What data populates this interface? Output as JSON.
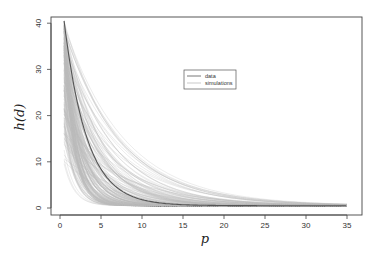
{
  "chart_data": {
    "type": "line",
    "title": "",
    "xlabel": "p",
    "ylabel": "h(d)",
    "xlim": [
      -1.5,
      37.5
    ],
    "ylim": [
      -1.5,
      41.5
    ],
    "x_ticks": [
      0,
      5,
      10,
      15,
      20,
      25,
      30,
      35
    ],
    "y_ticks": [
      0,
      10,
      20,
      30,
      40
    ],
    "grid": false,
    "legend": {
      "position": "upper-center",
      "entries": [
        {
          "label": "data",
          "color": "#555555"
        },
        {
          "label": "simulations",
          "color": "#bbbbbb"
        }
      ]
    },
    "series": [
      {
        "name": "data",
        "color": "#555555",
        "model": "h = 40*exp(-0.36*(p-0.5)) + 0.5",
        "x": [
          0.5,
          1,
          2,
          3,
          4,
          5,
          6,
          8,
          10,
          12,
          15,
          20,
          25,
          30,
          35
        ],
        "values": [
          40.0,
          33.9,
          23.8,
          16.8,
          11.8,
          8.4,
          5.9,
          3.1,
          1.8,
          1.1,
          0.7,
          0.5,
          0.5,
          0.5,
          0.5
        ]
      },
      {
        "name": "simulations",
        "color": "#bbbbbb",
        "count": 200,
        "description": "Family of decay curves starting at p=0.5 with initial heights between about 9 and 40 and decay rates between about 0.13 and 0.9, all converging to ~0.5 by p=35"
      }
    ]
  },
  "labels": {
    "xlabel": "p",
    "ylabel": "h(d)",
    "legend_data": "data",
    "legend_sim": "simulations"
  }
}
